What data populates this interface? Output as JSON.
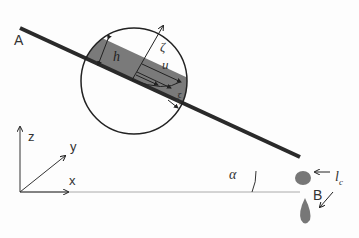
{
  "diagram": {
    "type": "thin film flow on inclined plate",
    "labels": {
      "A": "A",
      "B": "B",
      "h": "h",
      "zeta": "ζ",
      "u": "u",
      "xi": "ξ",
      "alpha": "α",
      "z": "z",
      "y": "y",
      "x": "x",
      "lc": "l",
      "lc_sub": "c"
    },
    "colors": {
      "film": "#7a7a7a",
      "plate": "#2a2a2a",
      "lines": "#222222",
      "drop": "#777777",
      "ground": "#aaaaaa"
    }
  }
}
